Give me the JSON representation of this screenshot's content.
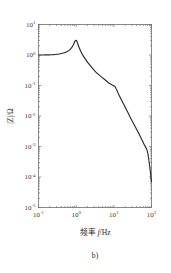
{
  "figure": {
    "caption": "b)",
    "background_color": "#ffffff",
    "curve_color": "#2b2b2b",
    "axis_color": "#6e6e6e"
  },
  "chart_data": {
    "type": "line",
    "title": "",
    "subtitle": "",
    "xlabel": "频率 f/Hz",
    "xlabel_cn": "频率",
    "xlabel_var": "f",
    "xlabel_unit": "/Hz",
    "ylabel": "|Z|/Ω",
    "ylabel_mag": "|Z|",
    "ylabel_unit": "/Ω",
    "xscale": "log",
    "yscale": "log",
    "xlim": [
      0.1,
      100
    ],
    "ylim": [
      1e-05,
      10
    ],
    "grid": false,
    "legend": null,
    "xticks": [
      0.1,
      1,
      10,
      100
    ],
    "xtick_labels": [
      "10⁻¹",
      "10⁰",
      "10¹",
      "10²"
    ],
    "xtick_mantissa": [
      "10",
      "10",
      "10",
      "10"
    ],
    "xtick_exponents": [
      "-1",
      "0",
      "1",
      "2"
    ],
    "yticks": [
      1e-05,
      0.0001,
      0.001,
      0.01,
      0.1,
      1,
      10
    ],
    "ytick_labels": [
      "10⁻⁵",
      "10⁻⁴",
      "10⁻³",
      "10⁻²",
      "10⁻¹",
      "10⁰",
      "10¹"
    ],
    "ytick_mantissa": [
      "10",
      "10",
      "10",
      "10",
      "10",
      "10",
      "10"
    ],
    "ytick_exponents": [
      "-5",
      "-4",
      "-3",
      "-2",
      "-1",
      "0",
      "1"
    ],
    "series": [
      {
        "name": "impedance-magnitude",
        "color": "#2b2b2b",
        "x": [
          0.1,
          0.13,
          0.17,
          0.22,
          0.28,
          0.36,
          0.46,
          0.55,
          0.65,
          0.75,
          0.85,
          0.92,
          0.97,
          1.0,
          1.03,
          1.07,
          1.12,
          1.2,
          1.35,
          1.55,
          1.8,
          2.2,
          2.8,
          3.5,
          4.5,
          5.6,
          7.0,
          8.2,
          9.0,
          9.6,
          10.0,
          10.4,
          11.0,
          12.0,
          14.0,
          18.0,
          24.0,
          32.0,
          45.0,
          62.0,
          80.0,
          100.0
        ],
        "y": [
          1.0,
          1.0,
          1.01,
          1.02,
          1.04,
          1.08,
          1.16,
          1.26,
          1.42,
          1.7,
          2.2,
          2.75,
          3.0,
          3.05,
          2.95,
          2.6,
          2.2,
          1.75,
          1.25,
          0.92,
          0.7,
          0.5,
          0.35,
          0.26,
          0.2,
          0.16,
          0.128,
          0.112,
          0.104,
          0.1,
          0.098,
          0.096,
          0.088,
          0.07,
          0.046,
          0.025,
          0.0125,
          0.0062,
          0.0028,
          0.00125,
          0.0006,
          7e-05
        ]
      }
    ],
    "annotations": [
      {
        "name": "resonance-peak",
        "x": 1.0,
        "y": 3.05
      },
      {
        "name": "antiresonance-notch",
        "x": 10.0,
        "y": 0.1
      }
    ]
  }
}
